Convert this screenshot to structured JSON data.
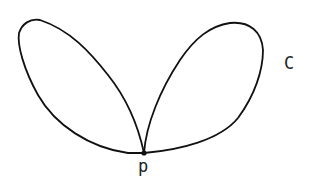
{
  "diagram": {
    "type": "curve-with-node",
    "curve_label": "C",
    "node_label": "p",
    "colors": {
      "stroke": "#111111",
      "background": "#ffffff",
      "label": "#222222"
    },
    "loops": [
      {
        "name": "left-loop"
      },
      {
        "name": "right-loop"
      }
    ]
  }
}
